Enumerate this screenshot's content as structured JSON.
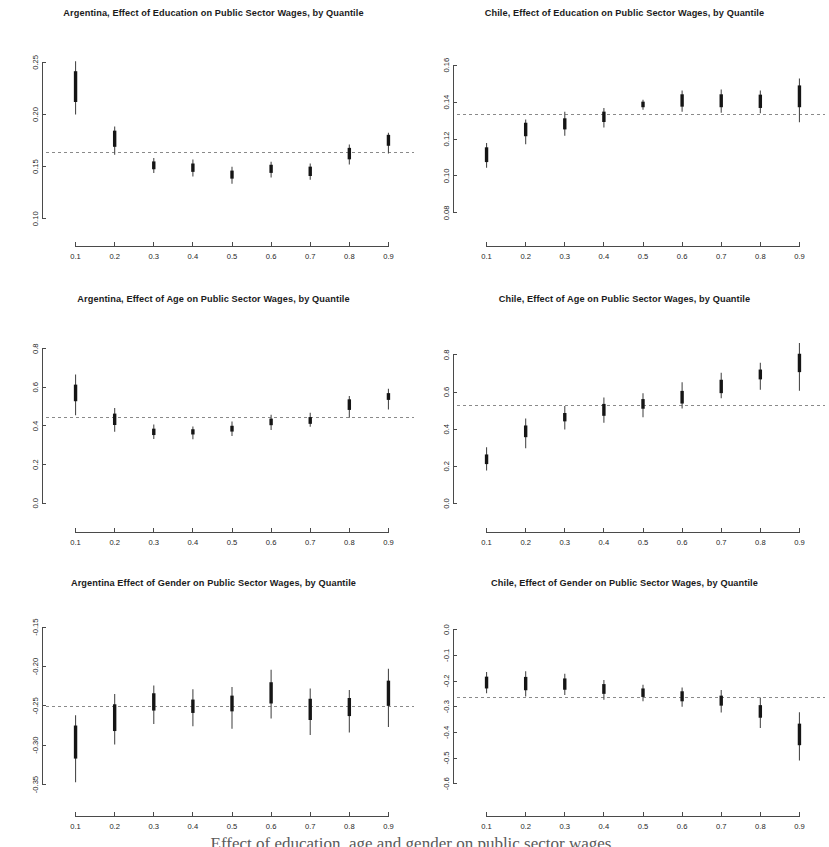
{
  "figure": {
    "width": 822,
    "height": 847,
    "background": "#ffffff",
    "ink_color": "#1a1a1a",
    "ref_line_color": "#8a8a8a",
    "box_color": "#151515",
    "whisker_color": "#4d4d4d",
    "caption_partial": "Effect of education, age and gender on public sector wages"
  },
  "chart_data": [
    {
      "id": "argentina-education",
      "type": "box",
      "title": "Argentina, Effect of Education on Public Sector Wages, by Quantile",
      "xlabel": "",
      "ylabel": "",
      "x": [
        0.1,
        0.2,
        0.3,
        0.4,
        0.5,
        0.6,
        0.7,
        0.8,
        0.9
      ],
      "xtick_labels": [
        "0.1",
        "0.2",
        "0.3",
        "0.4",
        "0.5",
        "0.6",
        "0.7",
        "0.8",
        "0.9"
      ],
      "ytick_labels": [
        "0.10",
        "0.15",
        "0.20",
        "0.25"
      ],
      "yticks": [
        0.1,
        0.15,
        0.2,
        0.25
      ],
      "ylim": [
        0.095,
        0.258
      ],
      "reference_line": 0.1635,
      "grid": false,
      "legend": "none",
      "estimates": [
        0.2255,
        0.1765,
        0.1515,
        0.1495,
        0.1425,
        0.148,
        0.1455,
        0.1625,
        0.1755
      ],
      "box_low": [
        0.212,
        0.169,
        0.1475,
        0.145,
        0.1385,
        0.144,
        0.141,
        0.157,
        0.17
      ],
      "box_high": [
        0.2415,
        0.1845,
        0.155,
        0.153,
        0.1462,
        0.1518,
        0.15,
        0.168,
        0.1805
      ],
      "whisk_low": [
        0.2,
        0.1615,
        0.144,
        0.1405,
        0.1335,
        0.1395,
        0.1375,
        0.152,
        0.1625
      ],
      "whisk_high": [
        0.251,
        0.1885,
        0.1582,
        0.1568,
        0.15,
        0.1548,
        0.153,
        0.1712,
        0.1825
      ]
    },
    {
      "id": "chile-education",
      "type": "box",
      "title": "Chile, Effect of Education on Public Sector Wages, by Quantile",
      "xlabel": "",
      "ylabel": "",
      "x": [
        0.1,
        0.2,
        0.3,
        0.4,
        0.5,
        0.6,
        0.7,
        0.8,
        0.9
      ],
      "xtick_labels": [
        "0.1",
        "0.2",
        "0.3",
        "0.4",
        "0.5",
        "0.6",
        "0.7",
        "0.8",
        "0.9"
      ],
      "ytick_labels": [
        "0.08",
        "0.10",
        "0.12",
        "0.14",
        "0.16"
      ],
      "yticks": [
        0.08,
        0.1,
        0.12,
        0.14,
        0.16
      ],
      "ylim": [
        0.074,
        0.166
      ],
      "reference_line": 0.133,
      "grid": false,
      "legend": "none",
      "estimates": [
        0.1115,
        0.125,
        0.1282,
        0.132,
        0.1388,
        0.141,
        0.1408,
        0.1405,
        0.144
      ],
      "box_low": [
        0.1075,
        0.1215,
        0.1252,
        0.1292,
        0.1372,
        0.1375,
        0.1372,
        0.1368,
        0.1372
      ],
      "box_high": [
        0.1155,
        0.1288,
        0.1312,
        0.1348,
        0.1402,
        0.1442,
        0.1442,
        0.144,
        0.149
      ],
      "whisk_low": [
        0.1045,
        0.1172,
        0.1218,
        0.1262,
        0.1358,
        0.1348,
        0.1342,
        0.134,
        0.129
      ],
      "whisk_high": [
        0.1178,
        0.1305,
        0.1348,
        0.1368,
        0.1412,
        0.1462,
        0.1468,
        0.1462,
        0.1528
      ]
    },
    {
      "id": "argentina-age",
      "type": "box",
      "title": "Argentina, Effect of Age on Public Sector Wages, by Quantile",
      "xlabel": "",
      "ylabel": "",
      "x": [
        0.1,
        0.2,
        0.3,
        0.4,
        0.5,
        0.6,
        0.7,
        0.8,
        0.9
      ],
      "xtick_labels": [
        "0.1",
        "0.2",
        "0.3",
        "0.4",
        "0.5",
        "0.6",
        "0.7",
        "0.8",
        "0.9"
      ],
      "ytick_labels": [
        "0.0",
        "0.2",
        "0.4",
        "0.6",
        "0.8"
      ],
      "yticks": [
        0.0,
        0.2,
        0.4,
        0.6,
        0.8
      ],
      "ylim": [
        -0.035,
        0.845
      ],
      "reference_line": 0.442,
      "grid": false,
      "legend": "none",
      "estimates": [
        0.576,
        0.438,
        0.37,
        0.37,
        0.386,
        0.422,
        0.428,
        0.511,
        0.556
      ],
      "box_low": [
        0.528,
        0.405,
        0.353,
        0.356,
        0.371,
        0.404,
        0.411,
        0.483,
        0.535
      ],
      "box_high": [
        0.614,
        0.464,
        0.386,
        0.383,
        0.401,
        0.438,
        0.446,
        0.538,
        0.57
      ],
      "whisk_low": [
        0.455,
        0.37,
        0.332,
        0.331,
        0.348,
        0.379,
        0.396,
        0.442,
        0.485
      ],
      "whisk_high": [
        0.667,
        0.493,
        0.408,
        0.397,
        0.423,
        0.458,
        0.468,
        0.555,
        0.593
      ]
    },
    {
      "id": "chile-age",
      "type": "box",
      "title": "Chile, Effect of Age on Public Sector Wages, by Quantile",
      "xlabel": "",
      "ylabel": "",
      "x": [
        0.1,
        0.2,
        0.3,
        0.4,
        0.5,
        0.6,
        0.7,
        0.8,
        0.9
      ],
      "xtick_labels": [
        "0.1",
        "0.2",
        "0.3",
        "0.4",
        "0.5",
        "0.6",
        "0.7",
        "0.8",
        "0.9"
      ],
      "ytick_labels": [
        "0.0",
        "0.2",
        "0.4",
        "0.6",
        "0.8"
      ],
      "yticks": [
        0.0,
        0.2,
        0.4,
        0.6,
        0.8
      ],
      "ylim": [
        -0.035,
        0.88
      ],
      "reference_line": 0.528,
      "grid": false,
      "legend": "none",
      "estimates": [
        0.238,
        0.387,
        0.464,
        0.506,
        0.538,
        0.57,
        0.634,
        0.699,
        0.76
      ],
      "box_low": [
        0.212,
        0.357,
        0.442,
        0.472,
        0.51,
        0.538,
        0.594,
        0.668,
        0.707
      ],
      "box_high": [
        0.264,
        0.42,
        0.487,
        0.536,
        0.562,
        0.606,
        0.666,
        0.721,
        0.806
      ],
      "whisk_low": [
        0.178,
        0.298,
        0.398,
        0.435,
        0.464,
        0.511,
        0.567,
        0.612,
        0.607
      ],
      "whisk_high": [
        0.303,
        0.458,
        0.525,
        0.57,
        0.594,
        0.653,
        0.704,
        0.757,
        0.864
      ]
    },
    {
      "id": "argentina-gender",
      "type": "box",
      "title": "Argentina Effect of Gender on Public Sector Wages, by Quantile",
      "xlabel": "",
      "ylabel": "",
      "x": [
        0.1,
        0.2,
        0.3,
        0.4,
        0.5,
        0.6,
        0.7,
        0.8,
        0.9
      ],
      "xtick_labels": [
        "0.1",
        "0.2",
        "0.3",
        "0.4",
        "0.5",
        "0.6",
        "0.7",
        "0.8",
        "0.9"
      ],
      "ytick_labels": [
        "-0.35",
        "-0.30",
        "-0.25",
        "-0.20",
        "-0.15"
      ],
      "yticks": [
        -0.35,
        -0.3,
        -0.25,
        -0.2,
        -0.15
      ],
      "ylim": [
        -0.362,
        -0.146
      ],
      "reference_line": -0.2505,
      "grid": false,
      "legend": "none",
      "estimates": [
        -0.2965,
        -0.267,
        -0.246,
        -0.252,
        -0.248,
        -0.238,
        -0.256,
        -0.253,
        -0.236
      ],
      "box_low": [
        -0.317,
        -0.282,
        -0.256,
        -0.259,
        -0.257,
        -0.247,
        -0.268,
        -0.263,
        -0.25
      ],
      "box_high": [
        -0.275,
        -0.248,
        -0.234,
        -0.242,
        -0.237,
        -0.22,
        -0.241,
        -0.24,
        -0.218
      ],
      "whisk_low": [
        -0.347,
        -0.299,
        -0.273,
        -0.276,
        -0.279,
        -0.266,
        -0.287,
        -0.284,
        -0.277
      ],
      "whisk_high": [
        -0.262,
        -0.235,
        -0.224,
        -0.229,
        -0.226,
        -0.204,
        -0.228,
        -0.23,
        -0.203
      ]
    },
    {
      "id": "chile-gender",
      "type": "box",
      "title": "Chile, Effect of Gender on Public Sector Wages, by Quantile",
      "xlabel": "",
      "ylabel": "",
      "x": [
        0.1,
        0.2,
        0.3,
        0.4,
        0.5,
        0.6,
        0.7,
        0.8,
        0.9
      ],
      "xtick_labels": [
        "0.1",
        "0.2",
        "0.3",
        "0.4",
        "0.5",
        "0.6",
        "0.7",
        "0.8",
        "0.9"
      ],
      "ytick_labels": [
        "-0.6",
        "-0.5",
        "-0.4",
        "-0.3",
        "-0.2",
        "-0.1",
        "0.0"
      ],
      "yticks": [
        -0.6,
        -0.5,
        -0.4,
        -0.3,
        -0.2,
        -0.1,
        0.0
      ],
      "ylim": [
        -0.64,
        0.022
      ],
      "reference_line": -0.264,
      "grid": false,
      "legend": "none",
      "estimates": [
        -0.202,
        -0.208,
        -0.211,
        -0.23,
        -0.245,
        -0.26,
        -0.275,
        -0.322,
        -0.415
      ],
      "box_low": [
        -0.229,
        -0.236,
        -0.234,
        -0.25,
        -0.262,
        -0.279,
        -0.296,
        -0.343,
        -0.45
      ],
      "box_high": [
        -0.183,
        -0.184,
        -0.19,
        -0.212,
        -0.229,
        -0.24,
        -0.257,
        -0.294,
        -0.366
      ],
      "whisk_low": [
        -0.248,
        -0.26,
        -0.254,
        -0.273,
        -0.279,
        -0.3,
        -0.323,
        -0.383,
        -0.51
      ],
      "whisk_high": [
        -0.165,
        -0.162,
        -0.172,
        -0.196,
        -0.215,
        -0.225,
        -0.235,
        -0.264,
        -0.322
      ]
    }
  ]
}
